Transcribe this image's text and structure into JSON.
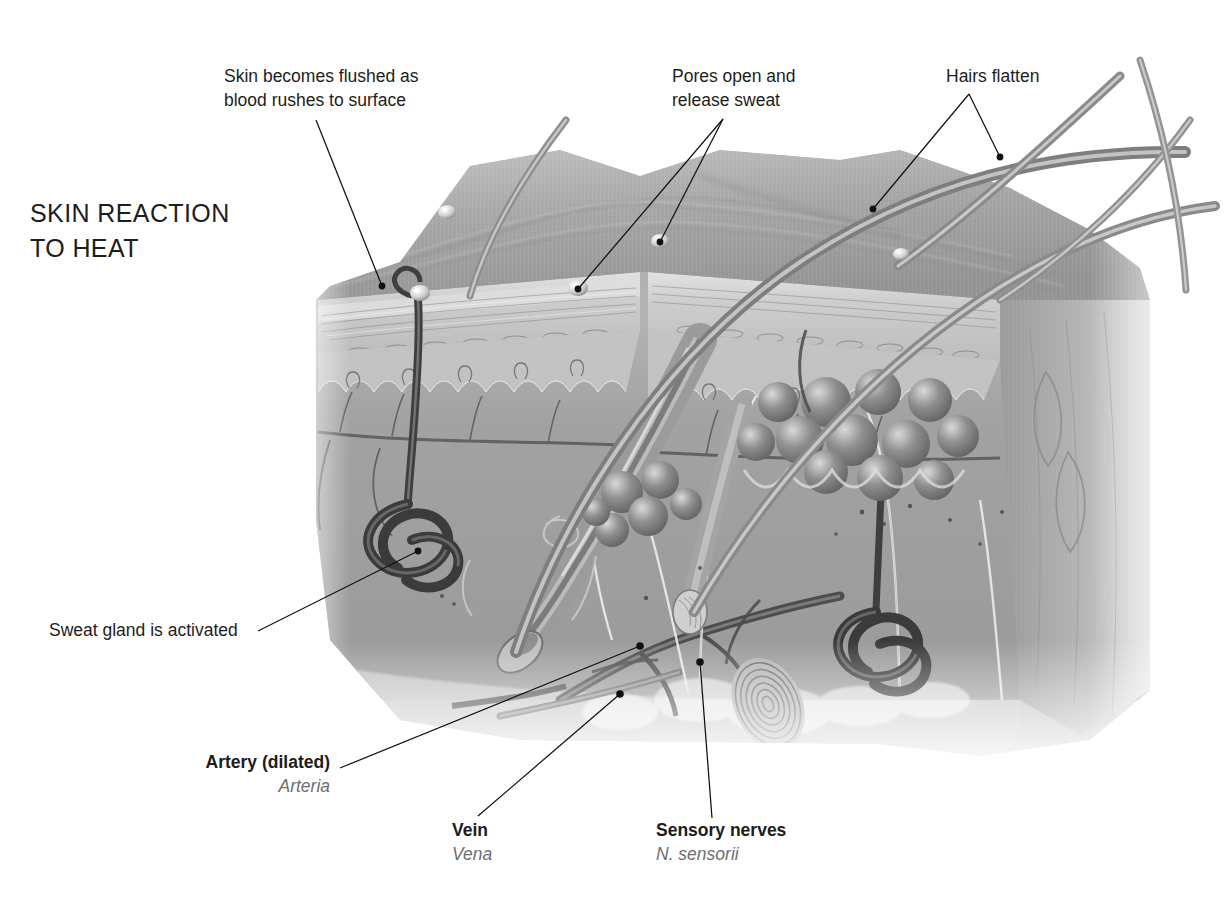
{
  "title": {
    "line1": "SKIN REACTION",
    "line2": "TO HEAT"
  },
  "labels": {
    "skin_flush": {
      "line1": "Skin becomes flushed as",
      "line2": "blood rushes to surface"
    },
    "pores": {
      "line1": "Pores open and",
      "line2": "release sweat"
    },
    "hairs": {
      "line1": "Hairs flatten"
    },
    "sweat_gland": {
      "line1": "Sweat gland is activated"
    },
    "artery": {
      "en": "Artery (dilated)",
      "la": "Arteria"
    },
    "vein": {
      "en": "Vein",
      "la": "Vena"
    },
    "nerves": {
      "en": "Sensory nerves",
      "la": "N. sensorii"
    }
  },
  "colors": {
    "text": "#1d1d1b",
    "latin": "#6e6e6e",
    "leader": "#111111",
    "skin_surface": "#a9a9a9",
    "epidermis": "#cfcfcf",
    "dermis": "#9c9c9c",
    "hypodermis": "#b4b4b4",
    "vessel_dark": "#4a4a4a",
    "gland": "#6a6a6a",
    "hair": "#8a8a8a"
  },
  "anatomy": {
    "layers": [
      "epidermis",
      "dermis",
      "hypodermis"
    ],
    "structures": [
      "sweat pore with droplet",
      "flattened hair shaft",
      "hair follicle",
      "sebaceous gland lobules",
      "eccrine sweat gland coil",
      "dilated artery",
      "vein",
      "sensory nerve fibres",
      "Pacinian corpuscle",
      "dermal papillae capillary loops"
    ]
  }
}
